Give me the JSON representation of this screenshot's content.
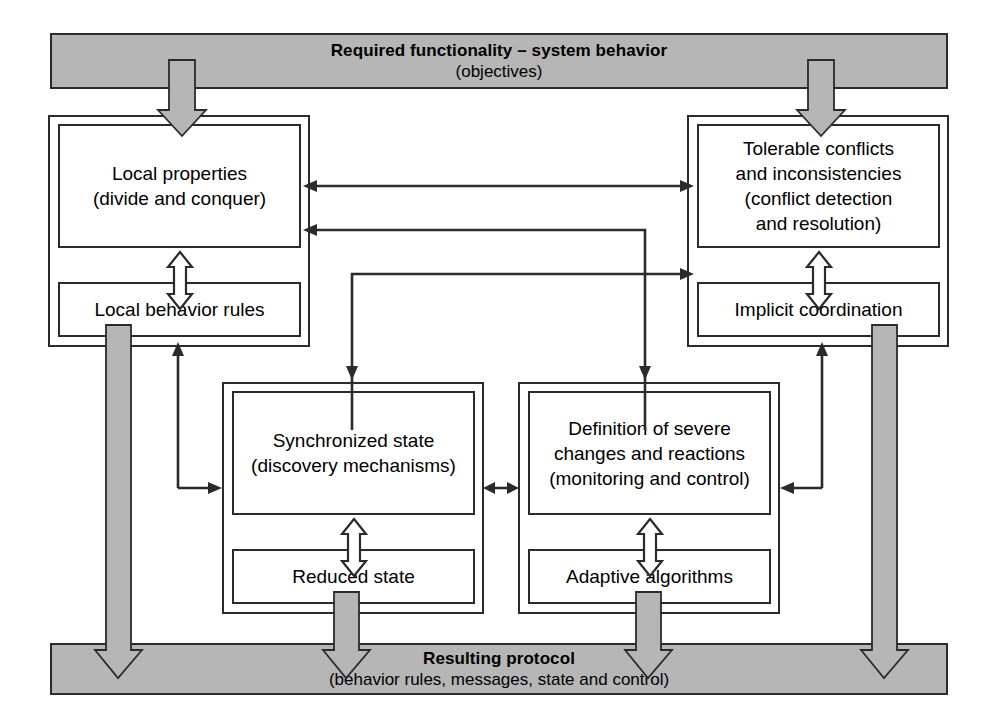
{
  "diagram": {
    "title_bar": {
      "line1": "Required functionality – system behavior",
      "line2": "(objectives)"
    },
    "bottom_bar": {
      "line1": "Resulting protocol",
      "line2": "(behavior rules, messages, state and control)"
    },
    "groups": [
      {
        "id": "top-left",
        "main": "Local properties\n(divide and conquer)",
        "sub": "Local behavior rules"
      },
      {
        "id": "top-right",
        "main": "Tolerable conflicts\nand inconsistencies\n(conflict detection\nand resolution)",
        "sub": "Implicit coordination"
      },
      {
        "id": "bottom-left",
        "main": "Synchronized state\n(discovery mechanisms)",
        "sub": "Reduced state"
      },
      {
        "id": "bottom-right",
        "main": "Definition of severe\nchanges and reactions\n(monitoring and control)",
        "sub": "Adaptive algorithms"
      }
    ],
    "colors": {
      "bar_fill": "#b6b6b6",
      "stroke": "#2b2b2b",
      "box_fill": "#ffffff"
    }
  }
}
